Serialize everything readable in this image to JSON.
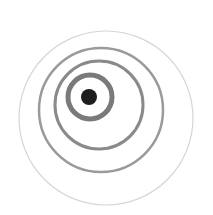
{
  "diagram": {
    "type": "eccentric-concentric-circles",
    "background": "#ffffff",
    "rings": [
      {
        "name": "outer-ring",
        "cx": 106,
        "cy": 118,
        "r": 87,
        "stroke": "#d6d6d6",
        "width": 1.2
      },
      {
        "name": "ring-4",
        "cx": 101,
        "cy": 110,
        "r": 62,
        "stroke": "#9a9a9a",
        "width": 2.5
      },
      {
        "name": "ring-3",
        "cx": 99,
        "cy": 105,
        "r": 44,
        "stroke": "#8a8a8a",
        "width": 3
      },
      {
        "name": "ring-2",
        "cx": 90,
        "cy": 97,
        "r": 22,
        "stroke": "#7a7a7a",
        "width": 5
      }
    ],
    "center_dot": {
      "cx": 89,
      "cy": 97,
      "r": 8,
      "fill": "#1e1e1e"
    }
  }
}
